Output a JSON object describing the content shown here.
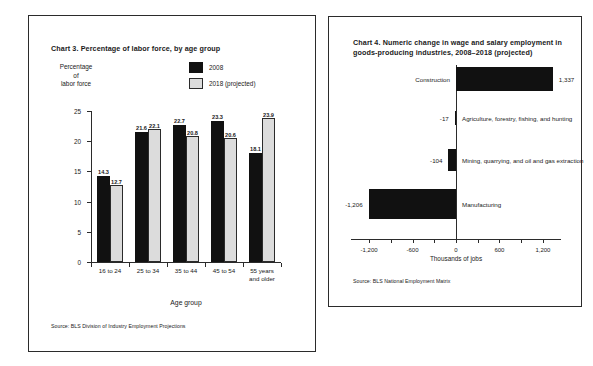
{
  "chart_data": [
    {
      "type": "bar",
      "title": "Chart 3. Percentage of labor force, by age group",
      "ylabel_lines": [
        "Percentage",
        "of",
        "labor force"
      ],
      "xlabel": "Age group",
      "categories": [
        "16 to 24",
        "25 to 34",
        "35 to 44",
        "45 to 54",
        "55 years and older"
      ],
      "category_lines": [
        [
          "16 to 24"
        ],
        [
          "25 to 34"
        ],
        [
          "35 to 44"
        ],
        [
          "45 to 54"
        ],
        [
          "55 years",
          "and older"
        ]
      ],
      "series": [
        {
          "name": "2008",
          "color": "#111111",
          "values": [
            14.3,
            21.6,
            22.7,
            23.3,
            18.1
          ]
        },
        {
          "name": "2018 (projected)",
          "color": "#dcdcdc",
          "values": [
            12.7,
            22.1,
            20.8,
            20.6,
            23.9
          ]
        }
      ],
      "yticks": [
        0,
        5,
        10,
        15,
        20,
        25
      ],
      "ylim": [
        0,
        25
      ],
      "grid": false,
      "legend_position": "top-right",
      "source": "Source: BLS Division of Industry Employment Projections"
    },
    {
      "type": "bar",
      "orientation": "horizontal",
      "title_lines": [
        "Chart 4. Numeric change in wage and salary employment in",
        "goods-producing industries, 2008–2018 (projected)"
      ],
      "title": "Chart 4. Numeric change in wage and salary employment in goods-producing industries, 2008–2018 (projected)",
      "xlabel": "Thousands of jobs",
      "categories": [
        "Construction",
        "Agriculture, forestry, fishing, and hunting",
        "Mining, quarrying, and oil and gas extraction",
        "Manufacturing"
      ],
      "values": [
        1337,
        -17,
        -104,
        -1206
      ],
      "value_labels": [
        "1,337",
        "-17",
        "-104",
        "-1,206"
      ],
      "xticks": [
        -1200,
        -600,
        0,
        600,
        1200
      ],
      "xtick_labels": [
        "-1,200",
        "-600",
        "0",
        "600",
        "1,200"
      ],
      "xlim": [
        -1450,
        1450
      ],
      "bar_color": "#111111",
      "grid": false,
      "source": "Source: BLS National Employment Matrix"
    }
  ]
}
